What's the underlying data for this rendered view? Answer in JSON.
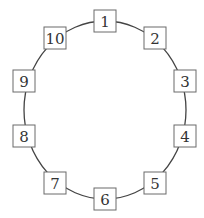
{
  "diagram": {
    "type": "circular-arrangement",
    "nodes": [
      {
        "label": "1"
      },
      {
        "label": "2"
      },
      {
        "label": "3"
      },
      {
        "label": "4"
      },
      {
        "label": "5"
      },
      {
        "label": "6"
      },
      {
        "label": "7"
      },
      {
        "label": "8"
      },
      {
        "label": "9"
      },
      {
        "label": "10"
      }
    ],
    "colors": {
      "ring": "#444444",
      "box_border": "#6a6a6a",
      "text": "#333333"
    }
  }
}
